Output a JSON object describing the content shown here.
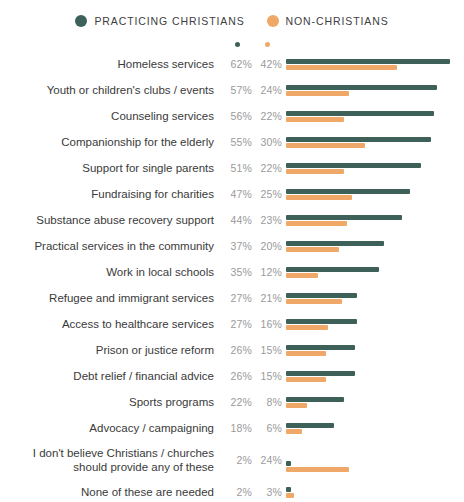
{
  "legend": {
    "items": [
      {
        "label": "PRACTICING CHRISTIANS",
        "color": "#3d6158",
        "icon": "circle-icon"
      },
      {
        "label": "NON-CHRISTIANS",
        "color": "#f0a868",
        "icon": "circle-icon"
      }
    ]
  },
  "colors": {
    "series_a": "#3d6158",
    "series_b": "#f0a868",
    "label": "#3a3a3a",
    "value": "#9a9a9a",
    "background": "#ffffff"
  },
  "chart_data": {
    "type": "bar",
    "title": "",
    "subtitle": "",
    "xlabel": "",
    "ylabel": "",
    "orientation": "horizontal",
    "grouping": "paired",
    "grid": false,
    "legend_position": "top-center",
    "xlim": [
      0,
      62
    ],
    "value_suffix": "%",
    "categories": [
      "Homeless services",
      "Youth or children's clubs / events",
      "Counseling services",
      "Companionship for the elderly",
      "Support for single parents",
      "Fundraising for charities",
      "Substance abuse recovery support",
      "Practical services in the community",
      "Work in local schools",
      "Refugee and immigrant services",
      "Access to healthcare services",
      "Prison or justice reform",
      "Debt relief / financial advice",
      "Sports programs",
      "Advocacy / campaigning",
      "I don't believe Christians / churches should provide any of these",
      "None of these are needed"
    ],
    "series": [
      {
        "name": "PRACTICING CHRISTIANS",
        "color": "#3d6158",
        "values": [
          62,
          57,
          56,
          55,
          51,
          47,
          44,
          37,
          35,
          27,
          27,
          26,
          26,
          22,
          18,
          2,
          2
        ],
        "labels": [
          "62%",
          "57%",
          "56%",
          "55%",
          "51%",
          "47%",
          "44%",
          "37%",
          "35%",
          "27%",
          "27%",
          "26%",
          "26%",
          "22%",
          "18%",
          "2%",
          "2%"
        ]
      },
      {
        "name": "NON-CHRISTIANS",
        "color": "#f0a868",
        "values": [
          42,
          24,
          22,
          30,
          22,
          25,
          23,
          20,
          12,
          21,
          16,
          15,
          15,
          8,
          6,
          24,
          3
        ],
        "labels": [
          "42%",
          "24%",
          "22%",
          "30%",
          "22%",
          "25%",
          "23%",
          "20%",
          "12%",
          "21%",
          "16%",
          "15%",
          "15%",
          "8%",
          "6%",
          "24%",
          "3%"
        ]
      }
    ]
  }
}
